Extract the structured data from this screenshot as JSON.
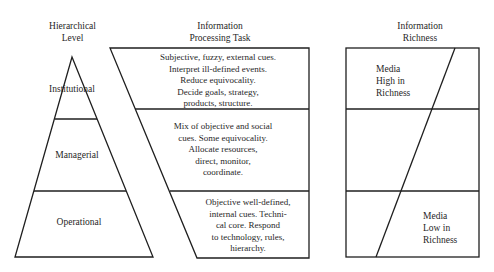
{
  "headers": {
    "level": "Hierarchical\nLevel",
    "task": "Information\nProcessing Task",
    "richness": "Information\nRichness"
  },
  "levels": [
    {
      "name": "Institutional"
    },
    {
      "name": "Managerial"
    },
    {
      "name": "Operational"
    }
  ],
  "tasks": [
    "Subjective, fuzzy, external cues.\nInterpret ill-defined events.\nReduce equivocality.\nDecide goals, strategy,\nproducts, structure.",
    "Mix of objective and social\ncues. Some equivocality.\nAllocate resources,\ndirect, monitor,\ncoordinate.",
    "Objective well-defined,\ninternal cues. Techni-\ncal core. Respond\nto technology, rules,\nhierarchy."
  ],
  "richness": {
    "high": "Media\nHigh in\nRichness",
    "low": "Media\nLow in\nRichness"
  },
  "colors": {
    "line": "#1f1f1f",
    "background": "#ffffff"
  }
}
